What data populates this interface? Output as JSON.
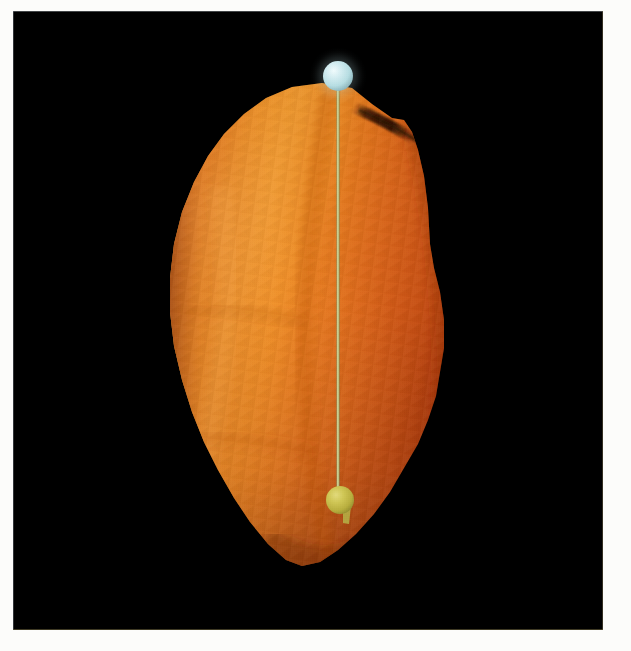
{
  "figure": {
    "kind": "3d-shape-model-render",
    "background_color": "#000000",
    "page_color": "#fcfcfa",
    "viewport": {
      "x": 13,
      "y": 11,
      "width": 590,
      "height": 619
    }
  },
  "body": {
    "name": "irregular-small-body-shape-model",
    "description": "Convex irregular polyhedral shape model rendered in orange, illuminated from the left",
    "lit_color": "#ec8a1c",
    "mid_color": "#e0701a",
    "terminator_color": "#c24a14",
    "shadow_color": "#8e3110",
    "highlight_color": "#f2a03a",
    "crease_color": "#5d2208",
    "silhouette_points": "322,83 352,88 372,104 392,118 404,120 412,132 418,150 424,176 428,208 430,244 434,268 440,292 444,320 444,348 440,372 436,396 428,420 418,444 404,468 390,492 374,514 356,534 338,550 320,562 302,566 286,560 268,544 250,522 234,498 218,470 204,442 192,412 182,380 174,346 170,312 170,278 174,244 182,212 194,182 208,156 224,134 244,114 266,98 292,87"
  },
  "rotation_axis": {
    "name": "rotation-axis-line",
    "color": "#c9cc8e",
    "shade_color": "#9ba06a",
    "x": 338,
    "y_top": 76,
    "y_bottom": 500,
    "width": 3
  },
  "north_pole_marker": {
    "name": "north-pole-sphere",
    "color": "#bfe2e6",
    "highlight_color": "#e8f6f8",
    "shadow_color": "#7ea8b0",
    "cx": 338,
    "cy": 76,
    "r": 15
  },
  "south_pole_marker": {
    "name": "south-pole-sphere",
    "color": "#c7bf4c",
    "highlight_color": "#ded66e",
    "shadow_color": "#8e8a2e",
    "cx": 340,
    "cy": 500,
    "r": 14,
    "tail": "emerging stub extending down-right"
  }
}
